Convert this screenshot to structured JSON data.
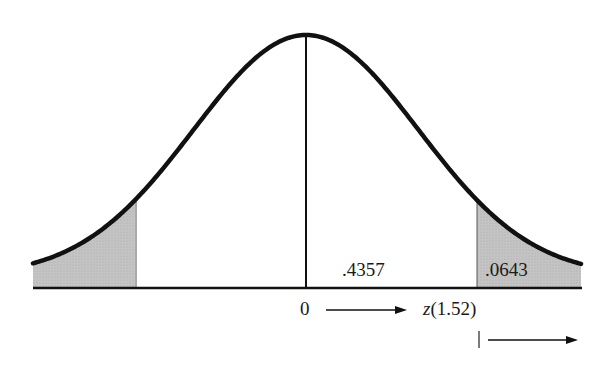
{
  "chart_data": {
    "type": "area",
    "title": "",
    "distribution": "standard normal",
    "mean": 0,
    "z_value": 1.52,
    "x_range": [
      -2.45,
      2.45
    ],
    "shaded_regions": [
      {
        "from": -2.45,
        "to": -1.52,
        "area": 0.0643,
        "labeled": false
      },
      {
        "from": 1.52,
        "to": 2.45,
        "area": 0.0643,
        "labeled": true
      }
    ],
    "annotations": [
      {
        "text": ".4357",
        "meaning": "area between 0 and z(1.52)"
      },
      {
        "text": ".0643",
        "meaning": "right-tail area beyond z(1.52)"
      },
      {
        "text": "0",
        "meaning": "mean / center tick label"
      },
      {
        "text": "z(1.52)",
        "meaning": "critical z value label"
      }
    ],
    "grid": false,
    "legend": null
  },
  "labels": {
    "center_area": ".4357",
    "tail_area": ".0643",
    "zero": "0",
    "z_prefix": "z",
    "z_value": "(1.52)"
  },
  "colors": {
    "curve": "#111111",
    "shade": "#c8c8c8",
    "axis": "#111111"
  }
}
